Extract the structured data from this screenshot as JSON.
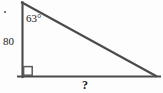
{
  "figure": {
    "type": "right-triangle-diagram",
    "background_color": "#fdfdfd",
    "stroke_color": "#4a4a4a",
    "text_color": "#1a1a1a",
    "labels": {
      "apex_angle": "63°",
      "vertical_leg": "80",
      "base_unknown": "?"
    },
    "markers": {
      "right_angle_vertex": "bottom-left"
    },
    "geometry": {
      "apex": [
        22,
        3
      ],
      "bottom_left": [
        22,
        76
      ],
      "bottom_right": [
        155,
        76
      ],
      "base_line_start": [
        17,
        76
      ],
      "base_line_end": [
        160,
        76
      ],
      "right_angle_box": [
        23,
        67,
        9,
        9
      ]
    }
  }
}
